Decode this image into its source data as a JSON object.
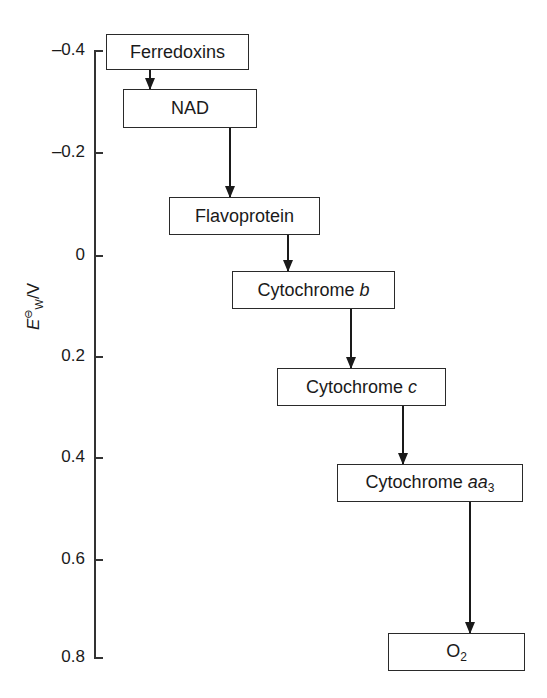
{
  "axis": {
    "label_symbol": "E",
    "label_superscript": "⊖",
    "label_subscript": "W",
    "label_unit": "/V",
    "ticks": [
      {
        "value": "–0.4",
        "y": 50
      },
      {
        "value": "–0.2",
        "y": 152
      },
      {
        "value": "0",
        "y": 255
      },
      {
        "value": "0.2",
        "y": 356
      },
      {
        "value": "0.4",
        "y": 457
      },
      {
        "value": "0.6",
        "y": 559
      },
      {
        "value": "0.8",
        "y": 657
      }
    ]
  },
  "nodes": [
    {
      "id": "ferredoxins",
      "label": "Ferredoxins",
      "potential_V": -0.43
    },
    {
      "id": "nad",
      "label": "NAD",
      "potential_V": -0.32
    },
    {
      "id": "flavoprotein",
      "label": "Flavoprotein",
      "potential_V": -0.06
    },
    {
      "id": "cytochrome-b",
      "label_main": "Cytochrome ",
      "label_italic": "b",
      "potential_V": 0.08
    },
    {
      "id": "cytochrome-c",
      "label_main": "Cytochrome ",
      "label_italic": "c",
      "potential_V": 0.25
    },
    {
      "id": "cytochrome-aa3",
      "label_main": "Cytochrome ",
      "label_italic": "aa",
      "label_sub": "3",
      "potential_V": 0.44
    },
    {
      "id": "o2",
      "label_main": "O",
      "label_sub": "2",
      "potential_V": 0.81
    }
  ],
  "edges": [
    {
      "from": "ferredoxins",
      "to": "nad"
    },
    {
      "from": "nad",
      "to": "flavoprotein"
    },
    {
      "from": "flavoprotein",
      "to": "cytochrome-b"
    },
    {
      "from": "cytochrome-b",
      "to": "cytochrome-c"
    },
    {
      "from": "cytochrome-c",
      "to": "cytochrome-aa3"
    },
    {
      "from": "cytochrome-aa3",
      "to": "o2"
    }
  ]
}
